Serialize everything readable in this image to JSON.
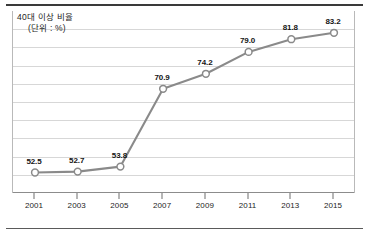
{
  "chart_data": {
    "type": "line",
    "title": "40대 이상 비율",
    "subtitle": "(단위 : %)",
    "xlabel": "",
    "ylabel": "",
    "categories": [
      "2001",
      "2003",
      "2005",
      "2007",
      "2009",
      "2011",
      "2013",
      "2015"
    ],
    "values": [
      52.5,
      52.7,
      53.8,
      70.9,
      74.2,
      79.0,
      81.8,
      83.2
    ],
    "labels": [
      "52.5",
      "52.7",
      "53.8",
      "70.9",
      "74.2",
      "79.0",
      "81.8",
      "83.2"
    ],
    "series": [
      {
        "name": "40대 이상 비율",
        "values": [
          52.5,
          52.7,
          53.8,
          70.9,
          74.2,
          79.0,
          81.8,
          83.2
        ]
      }
    ],
    "ylim": [
      48,
      88
    ],
    "grid": true,
    "gridlines": [
      52,
      56,
      60,
      64,
      68,
      72,
      76,
      80,
      84
    ],
    "legend": "none",
    "colors": {
      "line": "#8a8a8a",
      "marker_fill": "#ffffff",
      "marker_stroke": "#8a8a8a",
      "grid": "#d7d7d7",
      "axis": "#8c8c8c",
      "text": "#1d1d1d"
    }
  }
}
